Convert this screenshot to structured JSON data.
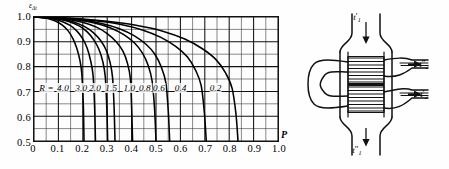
{
  "figure": {
    "kind": "engineering-effectiveness-chart-with-heat-exchanger-schematic"
  },
  "chart_data": {
    "type": "line",
    "title": "",
    "xlabel": "P",
    "ylabel": "ε",
    "ylabel_sub": "Δt",
    "xlim": [
      0,
      1.0
    ],
    "ylim": [
      0.5,
      1.0
    ],
    "grid": true,
    "x_major_step": 0.1,
    "y_major_step": 0.1,
    "x_minor_divisions": 2,
    "y_minor_divisions": 2,
    "xticks": [
      "0",
      "0.1",
      "0.2",
      "0.3",
      "0.4",
      "0.5",
      "0.6",
      "0.7",
      "0.8",
      "0.9",
      "1.0"
    ],
    "xtick_values": [
      0,
      0.1,
      0.2,
      0.3,
      0.4,
      0.5,
      0.6,
      0.7,
      0.8,
      0.9,
      1.0
    ],
    "yticks": [
      "1.0",
      "0.9",
      "0.8",
      "0.7",
      "0.6",
      "0.5"
    ],
    "ytick_values": [
      1.0,
      0.9,
      0.8,
      0.7,
      0.6,
      0.5
    ],
    "legend_prefix": "R =",
    "legend_position": "inline-on-curves",
    "series": [
      {
        "name": "4.0",
        "label": "R = 4.0",
        "x": [
          0.0,
          0.03,
          0.06,
          0.09,
          0.115,
          0.14,
          0.16,
          0.175,
          0.188,
          0.196,
          0.202,
          0.205
        ],
        "values": [
          1.0,
          0.998,
          0.993,
          0.983,
          0.968,
          0.944,
          0.912,
          0.875,
          0.826,
          0.77,
          0.65,
          0.5
        ]
      },
      {
        "name": "3.0",
        "label": "3.0",
        "x": [
          0.0,
          0.04,
          0.08,
          0.115,
          0.148,
          0.176,
          0.2,
          0.218,
          0.232,
          0.242,
          0.248,
          0.252
        ],
        "values": [
          1.0,
          0.998,
          0.992,
          0.982,
          0.966,
          0.943,
          0.912,
          0.874,
          0.824,
          0.765,
          0.65,
          0.5
        ]
      },
      {
        "name": "2.0",
        "label": "2.0",
        "x": [
          0.0,
          0.05,
          0.1,
          0.145,
          0.185,
          0.218,
          0.245,
          0.266,
          0.282,
          0.292,
          0.298,
          0.302
        ],
        "values": [
          1.0,
          0.998,
          0.992,
          0.981,
          0.964,
          0.94,
          0.908,
          0.87,
          0.82,
          0.76,
          0.645,
          0.5
        ]
      },
      {
        "name": "1.5",
        "label": "1.5",
        "x": [
          0.0,
          0.056,
          0.112,
          0.162,
          0.206,
          0.243,
          0.273,
          0.296,
          0.312,
          0.322,
          0.328,
          0.332
        ],
        "values": [
          1.0,
          0.998,
          0.991,
          0.98,
          0.962,
          0.937,
          0.905,
          0.866,
          0.816,
          0.756,
          0.642,
          0.5
        ]
      },
      {
        "name": "1.0",
        "label": "1.0",
        "x": [
          0.0,
          0.07,
          0.14,
          0.202,
          0.256,
          0.3,
          0.337,
          0.365,
          0.384,
          0.395,
          0.4,
          0.404
        ],
        "values": [
          1.0,
          0.997,
          0.99,
          0.978,
          0.959,
          0.933,
          0.9,
          0.861,
          0.81,
          0.75,
          0.638,
          0.5
        ]
      },
      {
        "name": "0.8",
        "label": "0.8",
        "x": [
          0.0,
          0.086,
          0.172,
          0.248,
          0.314,
          0.368,
          0.412,
          0.444,
          0.468,
          0.484,
          0.494,
          0.5
        ],
        "values": [
          1.0,
          0.997,
          0.989,
          0.976,
          0.956,
          0.929,
          0.895,
          0.855,
          0.804,
          0.742,
          0.632,
          0.5
        ]
      },
      {
        "name": "0.6",
        "label": "0.6",
        "x": [
          0.0,
          0.096,
          0.192,
          0.277,
          0.35,
          0.41,
          0.459,
          0.496,
          0.522,
          0.54,
          0.55,
          0.556
        ],
        "values": [
          1.0,
          0.996,
          0.988,
          0.974,
          0.953,
          0.925,
          0.89,
          0.849,
          0.797,
          0.736,
          0.626,
          0.5
        ]
      },
      {
        "name": "0.4",
        "label": "0.4",
        "x": [
          0.0,
          0.122,
          0.244,
          0.352,
          0.444,
          0.52,
          0.582,
          0.629,
          0.662,
          0.685,
          0.698,
          0.706
        ],
        "values": [
          1.0,
          0.996,
          0.986,
          0.971,
          0.948,
          0.918,
          0.881,
          0.839,
          0.786,
          0.724,
          0.616,
          0.5
        ]
      },
      {
        "name": "0.2",
        "label": "0.2",
        "x": [
          0.0,
          0.145,
          0.29,
          0.418,
          0.528,
          0.618,
          0.69,
          0.745,
          0.785,
          0.812,
          0.828,
          0.836
        ],
        "values": [
          1.0,
          0.995,
          0.984,
          0.967,
          0.943,
          0.911,
          0.872,
          0.829,
          0.775,
          0.712,
          0.606,
          0.5
        ]
      }
    ],
    "label_positions": [
      {
        "text": "R =",
        "x": 0.055,
        "y": 0.716,
        "italic": true
      },
      {
        "text": "4.0",
        "x": 0.122,
        "y": 0.716
      },
      {
        "text": "3.0",
        "x": 0.196,
        "y": 0.716
      },
      {
        "text": "2.0",
        "x": 0.252,
        "y": 0.716
      },
      {
        "text": "1.5",
        "x": 0.318,
        "y": 0.716
      },
      {
        "text": "1.0",
        "x": 0.392,
        "y": 0.716
      },
      {
        "text": "0.8",
        "x": 0.455,
        "y": 0.716
      },
      {
        "text": "0.6",
        "x": 0.512,
        "y": 0.716
      },
      {
        "text": "0.4",
        "x": 0.6,
        "y": 0.716
      },
      {
        "text": "0.2",
        "x": 0.742,
        "y": 0.716
      }
    ]
  },
  "schematic": {
    "name": "two-pass-shell-and-tube-heat-exchanger",
    "labels": [
      {
        "id": "hot-inlet",
        "base": "t",
        "prime": "′",
        "sub": "1",
        "x": 57,
        "y": 17
      },
      {
        "id": "cold-outlet",
        "base": "t",
        "prime": "″",
        "sub": "2",
        "x": 124,
        "y": 64
      },
      {
        "id": "cold-inlet",
        "base": "t",
        "prime": "′",
        "sub": "2",
        "x": 124,
        "y": 94
      },
      {
        "id": "hot-outlet",
        "base": "t",
        "prime": "″",
        "sub": "1",
        "x": 57,
        "y": 150
      }
    ]
  }
}
